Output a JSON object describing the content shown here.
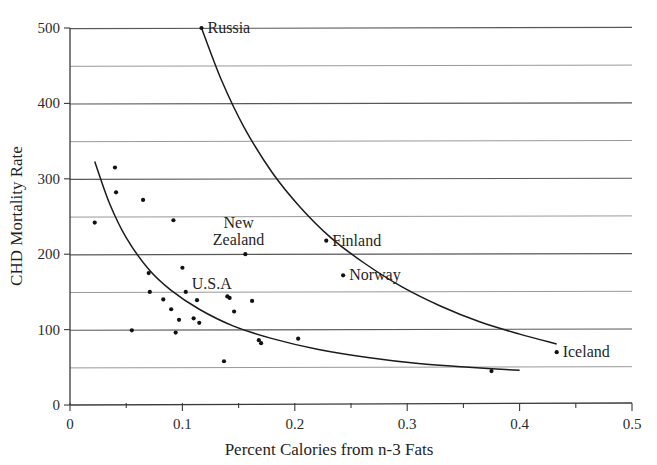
{
  "chart_data": {
    "type": "scatter",
    "title": "",
    "xlabel": "Percent Calories from n-3 Fats",
    "ylabel": "CHD Mortality Rate",
    "xlim": [
      0,
      0.5
    ],
    "ylim": [
      0,
      500
    ],
    "grid": true,
    "legend": "none",
    "x_ticks": [
      0,
      0.1,
      0.2,
      0.3,
      0.4,
      0.5
    ],
    "x_tick_labels": [
      "0",
      "0.1",
      "0.2",
      "0.3",
      "0.4",
      "0.5"
    ],
    "x_minor_ticks": [
      0.05,
      0.15,
      0.25,
      0.35,
      0.45
    ],
    "y_ticks": [
      0,
      100,
      200,
      300,
      400,
      500
    ],
    "y_tick_labels": [
      "0",
      "100",
      "200",
      "300",
      "400",
      "500"
    ],
    "y_gridlines": [
      50,
      100,
      150,
      200,
      250,
      300,
      350,
      400,
      450,
      500
    ],
    "points": [
      {
        "x": 0.022,
        "y": 242,
        "label": ""
      },
      {
        "x": 0.04,
        "y": 315,
        "label": ""
      },
      {
        "x": 0.041,
        "y": 282,
        "label": ""
      },
      {
        "x": 0.055,
        "y": 99,
        "label": ""
      },
      {
        "x": 0.065,
        "y": 272,
        "label": ""
      },
      {
        "x": 0.07,
        "y": 175,
        "label": ""
      },
      {
        "x": 0.071,
        "y": 150,
        "label": ""
      },
      {
        "x": 0.083,
        "y": 140,
        "label": ""
      },
      {
        "x": 0.09,
        "y": 127,
        "label": ""
      },
      {
        "x": 0.092,
        "y": 245,
        "label": ""
      },
      {
        "x": 0.094,
        "y": 96,
        "label": ""
      },
      {
        "x": 0.097,
        "y": 113,
        "label": ""
      },
      {
        "x": 0.1,
        "y": 182,
        "label": ""
      },
      {
        "x": 0.103,
        "y": 150,
        "label": "U.S.A"
      },
      {
        "x": 0.11,
        "y": 115,
        "label": ""
      },
      {
        "x": 0.113,
        "y": 139,
        "label": ""
      },
      {
        "x": 0.115,
        "y": 109,
        "label": ""
      },
      {
        "x": 0.117,
        "y": 500,
        "label": "Russia"
      },
      {
        "x": 0.137,
        "y": 58,
        "label": ""
      },
      {
        "x": 0.14,
        "y": 144,
        "label": ""
      },
      {
        "x": 0.142,
        "y": 142,
        "label": ""
      },
      {
        "x": 0.146,
        "y": 124,
        "label": ""
      },
      {
        "x": 0.156,
        "y": 200,
        "label": "New Zealand"
      },
      {
        "x": 0.162,
        "y": 138,
        "label": ""
      },
      {
        "x": 0.168,
        "y": 86,
        "label": ""
      },
      {
        "x": 0.17,
        "y": 82,
        "label": ""
      },
      {
        "x": 0.203,
        "y": 88,
        "label": ""
      },
      {
        "x": 0.228,
        "y": 218,
        "label": "Finland"
      },
      {
        "x": 0.243,
        "y": 172,
        "label": "Norway"
      },
      {
        "x": 0.375,
        "y": 45,
        "label": ""
      },
      {
        "x": 0.433,
        "y": 70,
        "label": "Iceland"
      }
    ],
    "curves": [
      {
        "name": "upper-fitted-curve",
        "points": [
          {
            "x": 0.117,
            "y": 500
          },
          {
            "x": 0.135,
            "y": 430
          },
          {
            "x": 0.155,
            "y": 368
          },
          {
            "x": 0.18,
            "y": 308
          },
          {
            "x": 0.205,
            "y": 262
          },
          {
            "x": 0.232,
            "y": 222
          },
          {
            "x": 0.262,
            "y": 188
          },
          {
            "x": 0.295,
            "y": 157
          },
          {
            "x": 0.33,
            "y": 131
          },
          {
            "x": 0.365,
            "y": 110
          },
          {
            "x": 0.4,
            "y": 94
          },
          {
            "x": 0.433,
            "y": 81
          }
        ]
      },
      {
        "name": "lower-fitted-curve",
        "points": [
          {
            "x": 0.022,
            "y": 323
          },
          {
            "x": 0.035,
            "y": 268
          },
          {
            "x": 0.05,
            "y": 222
          },
          {
            "x": 0.07,
            "y": 180
          },
          {
            "x": 0.09,
            "y": 152
          },
          {
            "x": 0.115,
            "y": 127
          },
          {
            "x": 0.145,
            "y": 105
          },
          {
            "x": 0.18,
            "y": 88
          },
          {
            "x": 0.22,
            "y": 74
          },
          {
            "x": 0.265,
            "y": 63
          },
          {
            "x": 0.31,
            "y": 55
          },
          {
            "x": 0.355,
            "y": 50
          },
          {
            "x": 0.4,
            "y": 46
          }
        ]
      }
    ],
    "annotations": [
      {
        "text": "Russia",
        "x": 0.117,
        "y": 500,
        "placement": "right"
      },
      {
        "text": "New",
        "x": 0.15,
        "y": 242,
        "placement": "center"
      },
      {
        "text": "Zealand",
        "x": 0.15,
        "y": 219,
        "placement": "center"
      },
      {
        "text": "Finland",
        "x": 0.228,
        "y": 218,
        "placement": "right"
      },
      {
        "text": "Norway",
        "x": 0.243,
        "y": 172,
        "placement": "right"
      },
      {
        "text": "U.S.A",
        "x": 0.103,
        "y": 160,
        "placement": "right"
      },
      {
        "text": "Iceland",
        "x": 0.433,
        "y": 70,
        "placement": "right"
      }
    ]
  },
  "labels": {
    "y_axis_title": "CHD Mortality Rate",
    "x_axis_title": "Percent Calories from n-3 Fats",
    "russia": "Russia",
    "new": "New",
    "zealand": "Zealand",
    "finland": "Finland",
    "norway": "Norway",
    "usa": "U.S.A",
    "iceland": "Iceland",
    "y0": "0",
    "y100": "100",
    "y200": "200",
    "y300": "300",
    "y400": "400",
    "y500": "500",
    "x0": "0",
    "x01": "0.1",
    "x02": "0.2",
    "x03": "0.3",
    "x04": "0.4",
    "x05": "0.5"
  }
}
